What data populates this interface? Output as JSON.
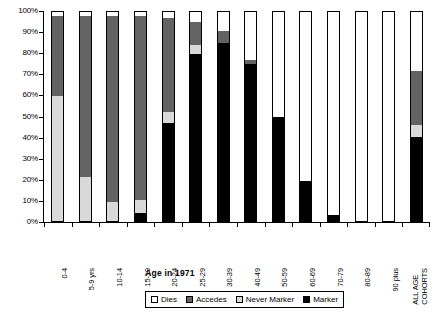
{
  "chart_data": {
    "type": "bar",
    "subtype": "stacked-percent",
    "title": "",
    "xlabel": "Age in 1971",
    "ylabel": "",
    "ylim": [
      0,
      100
    ],
    "grid": false,
    "legend_position": "bottom",
    "categories": [
      "0-4",
      "5-9 yrs",
      "10-14",
      "15-19",
      "20-24",
      "25-29",
      "30-39",
      "40-49",
      "50-59",
      "60-69",
      "70-79",
      "80-89",
      "90 plus",
      "ALL AGE COHORTS"
    ],
    "ytick_labels": [
      "0%",
      "10%",
      "20%",
      "30%",
      "40%",
      "50%",
      "60%",
      "70%",
      "80%",
      "90%",
      "100%"
    ],
    "ytick_values": [
      0,
      10,
      20,
      30,
      40,
      50,
      60,
      70,
      80,
      90,
      100
    ],
    "series": [
      {
        "name": "Marker",
        "color": "#000000",
        "values": [
          0,
          0,
          0,
          4,
          47,
          80,
          85,
          75,
          50,
          19,
          3,
          0,
          0,
          40
        ]
      },
      {
        "name": "Never Marker",
        "color": "#d9d9d9",
        "values": [
          60,
          21,
          9,
          6,
          5,
          4,
          0,
          0,
          0,
          0,
          0,
          0,
          0,
          6
        ]
      },
      {
        "name": "Accedes",
        "color": "#636363",
        "values": [
          38,
          77,
          89,
          88,
          45,
          11,
          6,
          2,
          0,
          0,
          0,
          0,
          0,
          26
        ]
      },
      {
        "name": "Dies",
        "color": "#ffffff",
        "values": [
          2,
          2,
          2,
          2,
          3,
          5,
          9,
          23,
          50,
          81,
          97,
          100,
          100,
          28
        ]
      }
    ],
    "legend_entries": [
      {
        "label": "Dies",
        "color": "#ffffff"
      },
      {
        "label": "Accedes",
        "color": "#636363"
      },
      {
        "label": "Never Marker",
        "color": "#d9d9d9"
      },
      {
        "label": "Marker",
        "color": "#000000"
      }
    ]
  }
}
